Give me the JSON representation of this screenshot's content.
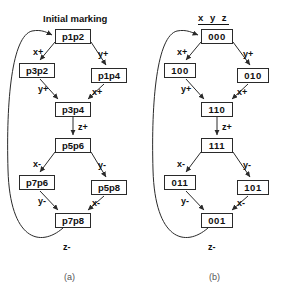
{
  "figure": {
    "panels": [
      {
        "id": "a",
        "caption": "(a)",
        "title": "Initial marking",
        "title_underlined": false,
        "nodes": [
          {
            "key": "top",
            "label": "p1p2",
            "x": 55,
            "y": 29,
            "w": 36,
            "h": 15
          },
          {
            "key": "left_upper",
            "label": "p3p2",
            "x": 19,
            "y": 63,
            "w": 36,
            "h": 15
          },
          {
            "key": "right_upper",
            "label": "p1p4",
            "x": 91,
            "y": 68,
            "w": 36,
            "h": 15
          },
          {
            "key": "mid_upper",
            "label": "p3p4",
            "x": 55,
            "y": 102,
            "w": 36,
            "h": 15
          },
          {
            "key": "mid_lower",
            "label": "p5p6",
            "x": 55,
            "y": 138,
            "w": 36,
            "h": 15
          },
          {
            "key": "left_lower",
            "label": "p7p6",
            "x": 19,
            "y": 175,
            "w": 36,
            "h": 15
          },
          {
            "key": "right_lower",
            "label": "p5p8",
            "x": 91,
            "y": 180,
            "w": 36,
            "h": 15
          },
          {
            "key": "bottom",
            "label": "p7p8",
            "x": 55,
            "y": 213,
            "w": 36,
            "h": 15
          }
        ],
        "edge_labels": [
          {
            "key": "top_to_left_upper",
            "text": "x+",
            "x": 33,
            "y": 48
          },
          {
            "key": "top_to_right_upper",
            "text": "y+",
            "x": 98,
            "y": 50
          },
          {
            "key": "left_upper_to_mid",
            "text": "y+",
            "x": 38,
            "y": 85
          },
          {
            "key": "right_upper_to_mid",
            "text": "x+",
            "x": 92,
            "y": 88
          },
          {
            "key": "mid_upper_to_mid_lower",
            "text": "z+",
            "x": 78,
            "y": 123
          },
          {
            "key": "mid_lower_to_left",
            "text": "x-",
            "x": 33,
            "y": 160
          },
          {
            "key": "mid_lower_to_right",
            "text": "y-",
            "x": 98,
            "y": 161
          },
          {
            "key": "left_lower_to_bottom",
            "text": "y-",
            "x": 38,
            "y": 197
          },
          {
            "key": "right_lower_to_bottom",
            "text": "x-",
            "x": 92,
            "y": 199
          },
          {
            "key": "bottom_to_top_feedback",
            "text": "z-",
            "x": 63,
            "y": 243
          }
        ]
      },
      {
        "id": "b",
        "caption": "(b)",
        "title": "x y z",
        "title_underlined": true,
        "nodes": [
          {
            "key": "top",
            "label": "000",
            "x": 59,
            "y": 29,
            "w": 32,
            "h": 15
          },
          {
            "key": "left_upper",
            "label": "100",
            "x": 22,
            "y": 63,
            "w": 32,
            "h": 15
          },
          {
            "key": "right_upper",
            "label": "010",
            "x": 95,
            "y": 68,
            "w": 32,
            "h": 15
          },
          {
            "key": "mid_upper",
            "label": "110",
            "x": 59,
            "y": 102,
            "w": 32,
            "h": 15
          },
          {
            "key": "mid_lower",
            "label": "111",
            "x": 59,
            "y": 138,
            "w": 32,
            "h": 15
          },
          {
            "key": "left_lower",
            "label": "011",
            "x": 22,
            "y": 175,
            "w": 32,
            "h": 15
          },
          {
            "key": "right_lower",
            "label": "101",
            "x": 95,
            "y": 180,
            "w": 32,
            "h": 15
          },
          {
            "key": "bottom",
            "label": "001",
            "x": 59,
            "y": 213,
            "w": 32,
            "h": 15
          }
        ],
        "edge_labels": [
          {
            "key": "top_to_left_upper",
            "text": "x+",
            "x": 35,
            "y": 48
          },
          {
            "key": "top_to_right_upper",
            "text": "y+",
            "x": 101,
            "y": 50
          },
          {
            "key": "left_upper_to_mid",
            "text": "y+",
            "x": 39,
            "y": 85
          },
          {
            "key": "right_upper_to_mid",
            "text": "x+",
            "x": 95,
            "y": 88
          },
          {
            "key": "mid_upper_to_mid_lower",
            "text": "z+",
            "x": 80,
            "y": 123
          },
          {
            "key": "mid_lower_to_left",
            "text": "x-",
            "x": 35,
            "y": 160
          },
          {
            "key": "mid_lower_to_right",
            "text": "y-",
            "x": 101,
            "y": 161
          },
          {
            "key": "left_lower_to_bottom",
            "text": "y-",
            "x": 39,
            "y": 197
          },
          {
            "key": "right_lower_to_bottom",
            "text": "x-",
            "x": 95,
            "y": 199
          },
          {
            "key": "bottom_to_top_feedback",
            "text": "z-",
            "x": 66,
            "y": 243
          }
        ]
      }
    ],
    "colors": {
      "stroke": "#2a2a2a",
      "text": "#111111",
      "caption": "#555555",
      "background": "#ffffff"
    }
  }
}
